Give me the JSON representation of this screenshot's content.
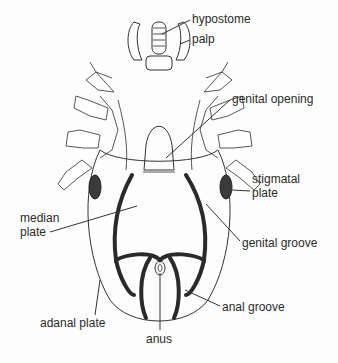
{
  "diagram": {
    "labels": {
      "hypostome": "hypostome",
      "palp": "palp",
      "genital_opening": "genital opening",
      "stigmatal_plate_line1": "stigmatal",
      "stigmatal_plate_line2": "plate",
      "median_plate_line1": "median",
      "median_plate_line2": "plate",
      "genital_groove": "genital groove",
      "anal_groove": "anal groove",
      "adanal_plate": "adanal plate",
      "anus": "anus"
    },
    "colors": {
      "line": "#333333",
      "background": "#fdfdfd"
    }
  }
}
